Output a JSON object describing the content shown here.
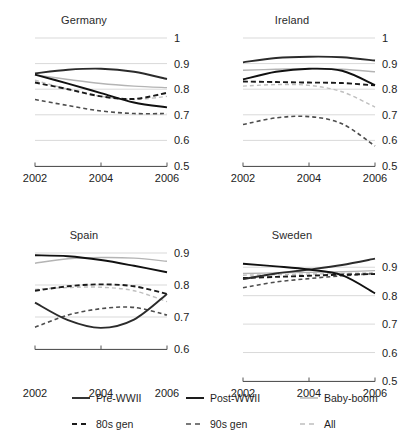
{
  "chart_data": {
    "type": "line",
    "title": "",
    "xlabel": "",
    "ylabel": "",
    "x": [
      2002,
      2003,
      2004,
      2005,
      2006
    ],
    "xticks": [
      "2002",
      "2004",
      "2006"
    ],
    "xlim": [
      2002,
      2006
    ],
    "grid": true,
    "legend_position": "bottom",
    "colors": {
      "dark": "#1a1a1a",
      "mid": "#555555",
      "light": "#bbbbbb",
      "grid": "#d9d9d9",
      "axis": "#555555"
    },
    "series_styles": [
      {
        "name": "Pre-WWII",
        "dash": "solid",
        "color": "#2b2b2b",
        "width": 1.9
      },
      {
        "name": "Post-WWII",
        "dash": "solid",
        "color": "#111111",
        "width": 1.9
      },
      {
        "name": "Baby-boom",
        "dash": "solid",
        "color": "#b4b4b4",
        "width": 1.4
      },
      {
        "name": "80s gen",
        "dash": "dashed",
        "color": "#1a1a1a",
        "width": 1.9
      },
      {
        "name": "90s gen",
        "dash": "dashed",
        "color": "#4d4d4d",
        "width": 1.6
      },
      {
        "name": "All",
        "dash": "dashed",
        "color": "#bfbfbf",
        "width": 1.4
      }
    ],
    "panels": [
      {
        "title": "Germany",
        "ylim": [
          0.5,
          1.0
        ],
        "yticks": [
          "1",
          "0.9",
          "0.8",
          "0.7",
          "0.6",
          "0.5"
        ],
        "ytickvals": [
          1.0,
          0.9,
          0.8,
          0.7,
          0.6,
          0.5
        ],
        "series": [
          {
            "name": "Pre-WWII",
            "values": [
              0.862,
              0.876,
              0.88,
              0.868,
              0.84
            ]
          },
          {
            "name": "Post-WWII",
            "values": [
              0.857,
              0.822,
              0.785,
              0.748,
              0.729
            ]
          },
          {
            "name": "Baby-boom",
            "values": [
              0.856,
              0.838,
              0.822,
              0.812,
              0.806
            ]
          },
          {
            "name": "80s gen",
            "values": [
              0.826,
              0.8,
              0.772,
              0.762,
              0.786
            ]
          },
          {
            "name": "90s gen",
            "values": [
              0.76,
              0.736,
              0.715,
              0.705,
              0.705
            ]
          },
          {
            "name": "All",
            "values": [
              0.835,
              0.8,
              0.772,
              0.76,
              0.772
            ]
          }
        ]
      },
      {
        "title": "Ireland",
        "ylim": [
          0.5,
          1.0
        ],
        "yticks": [
          "1",
          "0.9",
          "0.8",
          "0.7",
          "0.6",
          "0.5"
        ],
        "ytickvals": [
          1.0,
          0.9,
          0.8,
          0.7,
          0.6,
          0.5
        ],
        "series": [
          {
            "name": "Pre-WWII",
            "values": [
              0.905,
              0.922,
              0.927,
              0.925,
              0.912
            ]
          },
          {
            "name": "Post-WWII",
            "values": [
              0.838,
              0.868,
              0.88,
              0.872,
              0.816
            ]
          },
          {
            "name": "Baby-boom",
            "values": [
              0.874,
              0.878,
              0.88,
              0.878,
              0.868
            ]
          },
          {
            "name": "80s gen",
            "values": [
              0.83,
              0.828,
              0.826,
              0.824,
              0.815
            ]
          },
          {
            "name": "90s gen",
            "values": [
              0.662,
              0.688,
              0.693,
              0.665,
              0.578
            ]
          },
          {
            "name": "All",
            "values": [
              0.812,
              0.818,
              0.815,
              0.79,
              0.73
            ]
          }
        ]
      },
      {
        "title": "Spain",
        "ylim": [
          0.5,
          0.9
        ],
        "yticks": [
          "0.9",
          "0.8",
          "0.7",
          "0.6"
        ],
        "ytickvals": [
          0.9,
          0.8,
          0.7,
          0.6
        ],
        "series": [
          {
            "name": "Pre-WWII",
            "values": [
              0.745,
              0.69,
              0.666,
              0.692,
              0.772
            ]
          },
          {
            "name": "Post-WWII",
            "values": [
              0.893,
              0.89,
              0.878,
              0.86,
              0.84
            ]
          },
          {
            "name": "Baby-boom",
            "values": [
              0.868,
              0.882,
              0.886,
              0.884,
              0.874
            ]
          },
          {
            "name": "80s gen",
            "values": [
              0.782,
              0.796,
              0.802,
              0.796,
              0.772
            ]
          },
          {
            "name": "90s gen",
            "values": [
              0.668,
              0.706,
              0.726,
              0.73,
              0.706
            ]
          },
          {
            "name": "All",
            "values": [
              0.786,
              0.792,
              0.793,
              0.782,
              0.748
            ]
          }
        ]
      },
      {
        "title": "Sweden",
        "ylim": [
          0.5,
          0.95
        ],
        "yticks": [
          "0.9",
          "0.8",
          "0.7",
          "0.6",
          "0.5"
        ],
        "ytickvals": [
          0.9,
          0.8,
          0.7,
          0.6,
          0.5
        ],
        "series": [
          {
            "name": "Pre-WWII",
            "values": [
              0.858,
              0.878,
              0.892,
              0.908,
              0.93
            ]
          },
          {
            "name": "Post-WWII",
            "values": [
              0.912,
              0.903,
              0.892,
              0.872,
              0.808
            ]
          },
          {
            "name": "Baby-boom",
            "values": [
              0.878,
              0.88,
              0.882,
              0.884,
              0.888
            ]
          },
          {
            "name": "80s gen",
            "values": [
              0.862,
              0.866,
              0.87,
              0.874,
              0.876
            ]
          },
          {
            "name": "90s gen",
            "values": [
              0.828,
              0.848,
              0.86,
              0.87,
              0.878
            ]
          },
          {
            "name": "All",
            "values": [
              0.872,
              0.874,
              0.876,
              0.878,
              0.88
            ]
          }
        ]
      }
    ]
  },
  "legend": {
    "rows": [
      [
        {
          "label": "Pre-WWII",
          "style": "solid-dark"
        },
        {
          "label": "Post-WWII",
          "style": "solid-dark"
        },
        {
          "label": "Baby-boom",
          "style": "solid-light"
        }
      ],
      [
        {
          "label": "80s gen",
          "style": "dashed-dark"
        },
        {
          "label": "90s gen",
          "style": "dashed-mid"
        },
        {
          "label": "All",
          "style": "dashed-light"
        }
      ]
    ]
  }
}
